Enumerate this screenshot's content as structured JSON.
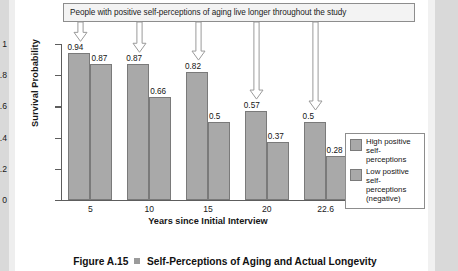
{
  "callout": {
    "text": "People with positive self-perceptions of aging live longer throughout the study"
  },
  "caption": {
    "figure_number": "Figure A.15",
    "title": "Self-Perceptions of Aging and Actual Longevity"
  },
  "legend": {
    "items": [
      {
        "label": "High positive self-perceptions",
        "color": "#a9a9a9"
      },
      {
        "label": "Low positive self-perceptions (negative)",
        "color": "#a9a9a9"
      }
    ]
  },
  "chart_data": {
    "type": "bar",
    "title": "Self-Perceptions of Aging and Actual Longevity",
    "xlabel": "Years since Initial Interview",
    "ylabel": "Survival Probability",
    "categories": [
      "5",
      "10",
      "15",
      "20",
      "22.6"
    ],
    "ylim": [
      0,
      1
    ],
    "yticks": [
      "0",
      "0.2",
      "0.4",
      "0.6",
      "0.8",
      "1"
    ],
    "grid": false,
    "legend_position": "right",
    "series": [
      {
        "name": "High positive self-perceptions",
        "color": "#a9a9a9",
        "values": [
          0.94,
          0.87,
          0.82,
          0.57,
          0.5
        ],
        "labels": [
          "0.94",
          "0.87",
          "0.82",
          "0.57",
          "0.5"
        ]
      },
      {
        "name": "Low positive self-perceptions (negative)",
        "color": "#a9a9a9",
        "values": [
          0.87,
          0.66,
          0.5,
          0.37,
          0.28
        ],
        "labels": [
          "0.87",
          "0.66",
          "0.5",
          "0.37",
          "0.28"
        ]
      }
    ],
    "annotations": [
      {
        "text": "People with positive self-perceptions of aging live longer throughout the study",
        "points_to": [
          "5",
          "10",
          "15",
          "20",
          "22.6"
        ]
      }
    ]
  }
}
